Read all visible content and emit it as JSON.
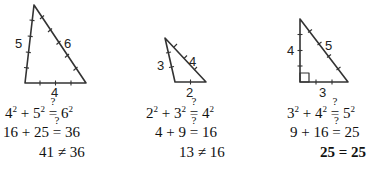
{
  "triangles": [
    {
      "sides": {
        "left": "5",
        "hyp": "6",
        "base": "4"
      },
      "equations": [
        {
          "a": "4",
          "b": "5",
          "c": "6",
          "op": "≟"
        },
        {
          "a": "16",
          "b": "25",
          "c": "36",
          "op": "≟"
        },
        {
          "lhs": "41",
          "rel": "≠",
          "rhs": "36"
        }
      ],
      "right_angle": false
    },
    {
      "sides": {
        "left": "3",
        "hyp": "4",
        "base": "2"
      },
      "equations": [
        {
          "a": "2",
          "b": "3",
          "c": "4",
          "op": "≟"
        },
        {
          "a": "4",
          "b": "9",
          "c": "16",
          "op": "≟"
        },
        {
          "lhs": "13",
          "rel": "≠",
          "rhs": "16"
        }
      ],
      "right_angle": false
    },
    {
      "sides": {
        "left": "4",
        "hyp": "5",
        "base": "3"
      },
      "equations": [
        {
          "a": "3",
          "b": "4",
          "c": "5",
          "op": "≟"
        },
        {
          "a": "9",
          "b": "16",
          "c": "25",
          "op": "≟"
        },
        {
          "lhs": "25",
          "rel": "=",
          "rhs": "25"
        }
      ],
      "right_angle": true
    }
  ],
  "symbols": {
    "plus": "+",
    "exp": "2",
    "question": "?",
    "equals": "="
  },
  "colors": {
    "line": "#333333",
    "text": "#111111"
  }
}
